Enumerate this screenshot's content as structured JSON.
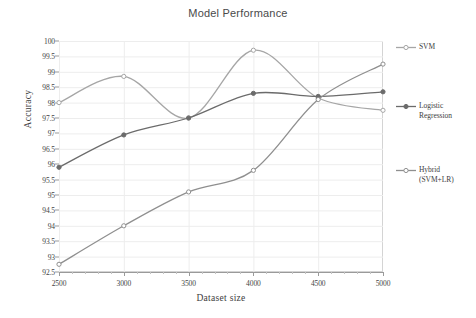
{
  "chart_data": {
    "type": "line",
    "title": "Model Performance",
    "xlabel": "Dataset size",
    "ylabel": "Accuracy",
    "x": [
      2500,
      3000,
      3500,
      4000,
      4500,
      5000
    ],
    "xlim": [
      2500,
      5000
    ],
    "ylim": [
      92.5,
      100
    ],
    "xticks": [
      "2500",
      "3000",
      "3500",
      "4000",
      "4500",
      "5000"
    ],
    "yticks": [
      "92.5",
      "93",
      "93.5",
      "94",
      "94.5",
      "95",
      "95.5",
      "96",
      "96.5",
      "97",
      "97.5",
      "98",
      "98.5",
      "99",
      "99.5",
      "100"
    ],
    "grid": true,
    "legend_position": "right",
    "smoothed": true,
    "series": [
      {
        "name": "SVM",
        "legend_label": "SVM",
        "values": [
          98.0,
          98.85,
          97.5,
          99.7,
          98.15,
          97.75
        ],
        "color": "#a6a6a6",
        "marker": "open-circle"
      },
      {
        "name": "Logistic Regression",
        "legend_label": "Logistic\nRegression",
        "values": [
          95.9,
          96.95,
          97.5,
          98.3,
          98.2,
          98.35
        ],
        "color": "#6b6b6b",
        "marker": "filled-circle"
      },
      {
        "name": "Hybrid (SVM+LR)",
        "legend_label": "Hybrid\n(SVM+LR)",
        "values": [
          92.75,
          94.0,
          95.1,
          95.8,
          98.1,
          99.25
        ],
        "color": "#8f8f8f",
        "marker": "open-circle"
      }
    ]
  },
  "style": {
    "grid_color": "#ededed",
    "axis_color": "#9a9a9a",
    "frame_color": "#d4d4d4",
    "background": "#ffffff",
    "title_color": "#4a4a4a"
  }
}
